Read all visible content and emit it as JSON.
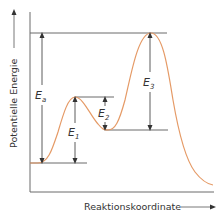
{
  "diagram": {
    "type": "energy-profile",
    "y_axis_label": "Potentielle Energie",
    "x_axis_label": "Reaktionskoordinate",
    "labels": {
      "Ea": {
        "main": "E",
        "sub": "a"
      },
      "E1": {
        "main": "E",
        "sub": "1"
      },
      "E2": {
        "main": "E",
        "sub": "2"
      },
      "E3": {
        "main": "E",
        "sub": "3"
      }
    },
    "levels": {
      "start": 163,
      "peak1": 97,
      "intermediate": 130,
      "peak2": 33
    },
    "colors": {
      "curve": "#e59a66",
      "level_lines": "#6b6b6b",
      "axes": "#6b6b6b",
      "arrows": "#333333"
    }
  }
}
